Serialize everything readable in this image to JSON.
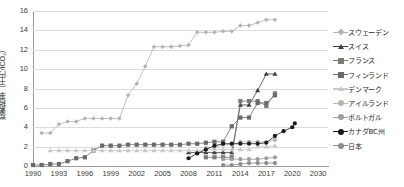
{
  "chart_data": {
    "type": "line",
    "title": "",
    "xlabel": "",
    "ylabel": "炭素税率（千円/tCO₂）",
    "ylim": [
      0,
      16
    ],
    "ytick_labels": [
      "0",
      "2",
      "4",
      "6",
      "8",
      "10",
      "12",
      "14",
      "16"
    ],
    "ytick_values": [
      0,
      2,
      4,
      6,
      8,
      10,
      12,
      14,
      16
    ],
    "xtick_labels": [
      "1990",
      "1993",
      "1996",
      "1999",
      "2002",
      "2005",
      "2008",
      "2011",
      "2014",
      "2017",
      "2020",
      "2030"
    ],
    "xtick_values": [
      1990,
      1993,
      1996,
      1999,
      2002,
      2005,
      2008,
      2011,
      2014,
      2017,
      2020,
      2030
    ],
    "grid": true,
    "legend_position": "right",
    "series": [
      {
        "name": "スウェーデン",
        "color": "#b3b3b3",
        "marker": "diamond",
        "x": [
          1991,
          1992,
          1993,
          1994,
          1995,
          1996,
          1997,
          1998,
          1999,
          2000,
          2001,
          2002,
          2003,
          2004,
          2005,
          2006,
          2007,
          2008,
          2009,
          2010,
          2011,
          2012,
          2013,
          2014,
          2015,
          2016,
          2017,
          2018
        ],
        "values": [
          3.4,
          3.4,
          4.3,
          4.6,
          4.6,
          4.9,
          4.9,
          4.9,
          4.9,
          4.9,
          7.3,
          8.5,
          10.3,
          12.3,
          12.3,
          12.3,
          12.4,
          12.5,
          13.8,
          13.8,
          13.8,
          13.9,
          13.9,
          14.5,
          14.5,
          14.8,
          15.1,
          15.1
        ]
      },
      {
        "name": "スイス",
        "color": "#3f3f3f",
        "marker": "triangle",
        "x": [
          2008,
          2009,
          2010,
          2011,
          2012,
          2013,
          2014,
          2015,
          2016,
          2017,
          2018
        ],
        "values": [
          1.4,
          1.4,
          1.4,
          1.4,
          1.4,
          1.4,
          6.3,
          6.3,
          7.8,
          9.5,
          9.5
        ]
      },
      {
        "name": "フランス",
        "color": "#7a7a7a",
        "marker": "square",
        "x": [
          2010,
          2011,
          2012,
          2013,
          2014,
          2015,
          2016,
          2017,
          2018
        ],
        "values": [
          0.9,
          0.9,
          0.9,
          0.9,
          6.7,
          6.7,
          6.7,
          6.2,
          7.5
        ]
      },
      {
        "name": "フィンランド",
        "color": "#6a6a6a",
        "marker": "square",
        "x": [
          1990,
          1991,
          1992,
          1993,
          1994,
          1995,
          1996,
          1997,
          1998,
          1999,
          2000,
          2001,
          2002,
          2003,
          2004,
          2005,
          2006,
          2007,
          2008,
          2009,
          2010,
          2011,
          2012,
          2013,
          2014,
          2015,
          2016,
          2017,
          2018
        ],
        "values": [
          0.1,
          0.1,
          0.2,
          0.2,
          0.5,
          0.8,
          0.9,
          1.6,
          2.1,
          2.1,
          2.1,
          2.2,
          2.2,
          2.2,
          2.2,
          2.2,
          2.2,
          2.2,
          2.3,
          2.3,
          2.4,
          2.5,
          2.5,
          4.1,
          5.0,
          5.0,
          6.5,
          6.5,
          7.3
        ]
      },
      {
        "name": "デンマーク",
        "color": "#c9c9c9",
        "marker": "triangle",
        "x": [
          1992,
          1993,
          1994,
          1995,
          1996,
          1997,
          1998,
          1999,
          2000,
          2001,
          2002,
          2003,
          2004,
          2005,
          2006,
          2007,
          2008,
          2009,
          2010,
          2011,
          2012,
          2013,
          2014,
          2015,
          2016,
          2017,
          2018
        ],
        "values": [
          1.6,
          1.6,
          1.6,
          1.6,
          1.6,
          1.6,
          1.6,
          1.6,
          1.6,
          1.6,
          1.6,
          1.6,
          1.6,
          1.6,
          1.6,
          1.6,
          1.6,
          1.6,
          1.7,
          1.7,
          1.7,
          1.7,
          1.7,
          1.7,
          2.0,
          2.0,
          2.1
        ]
      },
      {
        "name": "アイルランド",
        "color": "#b7b7b7",
        "marker": "circle",
        "x": [
          2010,
          2011,
          2012,
          2013,
          2014,
          2015,
          2016,
          2017,
          2018
        ],
        "values": [
          1.9,
          1.9,
          2.2,
          2.2,
          2.5,
          2.5,
          2.5,
          2.5,
          2.7
        ]
      },
      {
        "name": "ポルトガル",
        "color": "#9e9e9e",
        "marker": "circle",
        "x": [
          2012,
          2013,
          2014,
          2015,
          2016,
          2017,
          2018
        ],
        "values": [
          0.7,
          0.7,
          0.7,
          0.7,
          0.7,
          0.8,
          0.9
        ]
      },
      {
        "name": "カナダBC州",
        "color": "#1a1a1a",
        "marker": "circle",
        "x": [
          2008,
          2009,
          2010,
          2011,
          2012,
          2013,
          2014,
          2015,
          2016,
          2017,
          2018,
          2019,
          2020,
          2021
        ],
        "values": [
          0.8,
          1.3,
          1.7,
          2.1,
          2.3,
          2.3,
          2.3,
          2.3,
          2.3,
          2.4,
          3.1,
          3.6,
          4.0,
          4.4
        ]
      },
      {
        "name": "日本",
        "color": "#8c8c8c",
        "marker": "circle",
        "x": [
          2012,
          2013,
          2014,
          2015,
          2016,
          2017,
          2018
        ],
        "values": [
          0.1,
          0.1,
          0.2,
          0.3,
          0.3,
          0.3,
          0.3
        ]
      }
    ]
  },
  "legend": {
    "entries": [
      {
        "label": "スウェーデン",
        "color": "#b3b3b3",
        "marker": "diamond"
      },
      {
        "label": "スイス",
        "color": "#3f3f3f",
        "marker": "triangle"
      },
      {
        "label": "フランス",
        "color": "#7a7a7a",
        "marker": "square"
      },
      {
        "label": "フィンランド",
        "color": "#6a6a6a",
        "marker": "square"
      },
      {
        "label": "デンマーク",
        "color": "#c9c9c9",
        "marker": "triangle"
      },
      {
        "label": "アイルランド",
        "color": "#b7b7b7",
        "marker": "circle"
      },
      {
        "label": "ポルトガル",
        "color": "#9e9e9e",
        "marker": "circle"
      },
      {
        "label": "カナダBC州",
        "color": "#1a1a1a",
        "marker": "circle"
      },
      {
        "label": "日本",
        "color": "#8c8c8c",
        "marker": "circle"
      }
    ]
  }
}
